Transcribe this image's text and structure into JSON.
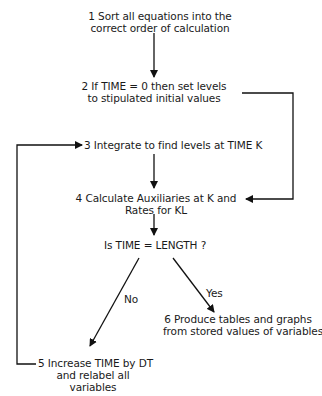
{
  "diagram": {
    "type": "flowchart",
    "steps": [
      {
        "id": 1,
        "line1": "1  Sort all equations into the",
        "line2": "correct order of calculation"
      },
      {
        "id": 2,
        "line1": "2  If TIME = 0 then set levels",
        "line2": "to stipulated initial values"
      },
      {
        "id": 3,
        "line1": "3  Integrate to find levels at TIME K"
      },
      {
        "id": 4,
        "line1": "4  Calculate Auxiliaries at K and",
        "line2": "Rates for KL"
      },
      {
        "id": 5,
        "line1": "5  Increase TIME by DT",
        "line2": "and relabel all",
        "line3": "variables"
      },
      {
        "id": 6,
        "line1": "6  Produce tables and graphs",
        "line2": "from stored values of variables"
      }
    ],
    "decision": {
      "label": "Is TIME = LENGTH ?",
      "no_label": "No",
      "yes_label": "Yes"
    },
    "edges": [
      {
        "from": 1,
        "to": 2
      },
      {
        "from": 2,
        "to": 4
      },
      {
        "from": 3,
        "to": 4
      },
      {
        "from": 4,
        "to": "decision"
      },
      {
        "from": "decision",
        "to": 5,
        "label": "No"
      },
      {
        "from": "decision",
        "to": 6,
        "label": "Yes"
      },
      {
        "from": 5,
        "to": 3
      }
    ]
  }
}
